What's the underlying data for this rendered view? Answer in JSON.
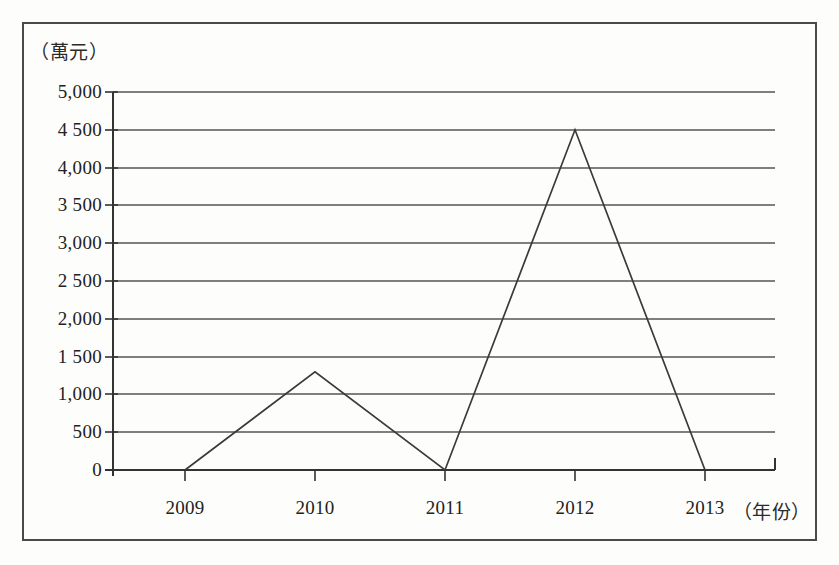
{
  "figure": {
    "unit_caption": "（萬元）",
    "xaxis_title": "（年份）"
  },
  "chart_data": {
    "type": "line",
    "title": "",
    "subtitle": "",
    "xlabel": "（年份）",
    "ylabel": "（萬元）",
    "categories": [
      "2009",
      "2010",
      "2011",
      "2012",
      "2013"
    ],
    "values": [
      0,
      1300,
      0,
      4500,
      0
    ],
    "series": [
      {
        "name": "",
        "values": [
          0,
          1300,
          0,
          4500,
          0
        ]
      }
    ],
    "ylim": [
      0,
      5000
    ],
    "ytick_values": [
      0,
      500,
      1000,
      1500,
      2000,
      2500,
      3000,
      3500,
      4000,
      4500,
      5000
    ],
    "ytick_labels": [
      "0",
      "500",
      "1,000",
      "1 500",
      "2,000",
      "2 500",
      "3,000",
      "3 500",
      "4,000",
      "4 500",
      "5,000"
    ],
    "xtick_labels": [
      "2009",
      "2010",
      "2011",
      "2012",
      "2013"
    ],
    "grid": true,
    "grid_axis": "y",
    "legend": false,
    "legend_position": "none",
    "annotations": []
  },
  "style": {
    "line_color": "#3a3a3a",
    "grid_color": "#555555",
    "axis_color": "#333333",
    "text_color": "#222222",
    "background": "#fdfdfb",
    "border_color": "#4a4a4a"
  }
}
